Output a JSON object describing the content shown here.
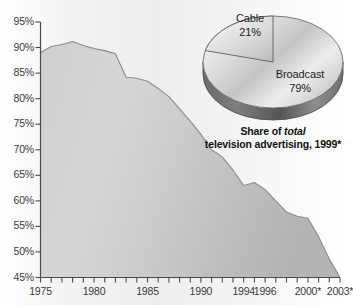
{
  "chart_data": [
    {
      "type": "area",
      "title": "",
      "xlabel": "",
      "ylabel": "",
      "ylim": [
        45,
        95
      ],
      "ytick_values": [
        45,
        50,
        55,
        60,
        65,
        70,
        75,
        80,
        85,
        90,
        95
      ],
      "ytick_labels": [
        "45%",
        "50%",
        "55%",
        "60%",
        "65%",
        "70%",
        "75%",
        "80%",
        "85%",
        "90%",
        "95%"
      ],
      "xlim": [
        1975,
        2003
      ],
      "xtick_labels": [
        "1975",
        "1980",
        "1985",
        "1990",
        "1994",
        "1996",
        "2000*",
        "2003*"
      ],
      "xtick_values": [
        1975,
        1980,
        1985,
        1990,
        1994,
        1996,
        2000,
        2003
      ],
      "grid": false,
      "legend": "none",
      "series_name": "Broadcast share of television advertising",
      "x": [
        1975,
        1976,
        1977,
        1978,
        1979,
        1980,
        1981,
        1982,
        1983,
        1984,
        1985,
        1986,
        1987,
        1988,
        1989,
        1990,
        1991,
        1992,
        1993,
        1994,
        1995,
        1996,
        1997,
        1998,
        1999,
        2000,
        2001,
        2002,
        2003
      ],
      "values": [
        89.0,
        90.2,
        90.6,
        91.2,
        90.4,
        89.8,
        89.4,
        88.8,
        84.2,
        84.0,
        83.4,
        82.0,
        80.4,
        78.0,
        75.6,
        73.0,
        70.0,
        68.6,
        66.0,
        63.0,
        63.6,
        62.2,
        60.0,
        57.8,
        57.0,
        56.6,
        53.0,
        48.6,
        45.0
      ]
    },
    {
      "type": "pie",
      "title": "Share of total television advertising, 1999*",
      "labels": [
        "Cable",
        "Broadcast"
      ],
      "values": [
        21,
        79
      ],
      "value_labels": [
        "21%",
        "79%"
      ],
      "legend": "none",
      "three_d": true
    }
  ],
  "area": {
    "yticks": [
      {
        "label": "95%",
        "value": 95
      },
      {
        "label": "90%",
        "value": 90
      },
      {
        "label": "85%",
        "value": 85
      },
      {
        "label": "80%",
        "value": 80
      },
      {
        "label": "75%",
        "value": 75
      },
      {
        "label": "70%",
        "value": 70
      },
      {
        "label": "65%",
        "value": 65
      },
      {
        "label": "60%",
        "value": 60
      },
      {
        "label": "55%",
        "value": 55
      },
      {
        "label": "50%",
        "value": 50
      },
      {
        "label": "45%",
        "value": 45
      }
    ],
    "xticks": [
      {
        "label": "1975",
        "value": 1975
      },
      {
        "label": "1980",
        "value": 1980
      },
      {
        "label": "1985",
        "value": 1985
      },
      {
        "label": "1990",
        "value": 1990
      },
      {
        "label": "1994",
        "value": 1994
      },
      {
        "label": "1996",
        "value": 1996
      },
      {
        "label": "2000*",
        "value": 2000
      },
      {
        "label": "2003*",
        "value": 2003
      }
    ]
  },
  "pie": {
    "slices": [
      {
        "name": "Cable",
        "label": "Cable",
        "percent_label": "21%",
        "percent": 21
      },
      {
        "name": "Broadcast",
        "label": "Broadcast",
        "percent_label": "79%",
        "percent": 79
      }
    ],
    "caption_line1_prefix": "Share of ",
    "caption_line1_italic": "total",
    "caption_line2": "television advertising, 1999*"
  },
  "colors": {
    "area_fill": "#d2d2d2",
    "area_stroke": "#8a8a8a",
    "axis": "#4a4a4a",
    "text": "#2f2f2f",
    "pie_light": "#efefef",
    "pie_mid": "#c9c9c9",
    "pie_dark": "#9b9b9b",
    "pie_rim": "#6e6e6e",
    "background": "#ffffff"
  }
}
